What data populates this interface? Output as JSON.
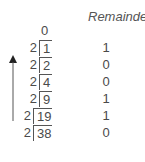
{
  "header": {
    "remainder_label": "Remainder"
  },
  "quotient_top": "0",
  "divisor": "2",
  "rows": [
    {
      "dividend": "1",
      "remainder": "1"
    },
    {
      "dividend": "2",
      "remainder": "0"
    },
    {
      "dividend": "4",
      "remainder": "0"
    },
    {
      "dividend": "9",
      "remainder": "1"
    },
    {
      "dividend": "19",
      "remainder": "1"
    },
    {
      "dividend": "38",
      "remainder": "0"
    }
  ],
  "arrow": {
    "direction": "up",
    "icon": "arrow-up-icon",
    "meaning": "read remainders bottom to top"
  },
  "colors": {
    "text": "#4a4a4a",
    "lines": "#555555",
    "background": "#ffffff"
  }
}
